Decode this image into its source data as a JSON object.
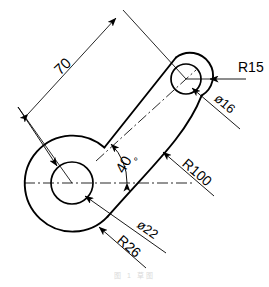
{
  "drawing": {
    "title": "Rocker arm / link plate engineering sketch",
    "type": "2d-technical-drawing",
    "units": "mm",
    "stroke_color": "#000000",
    "background_color": "#ffffff",
    "caption": "图 1    草图"
  },
  "dimensions": [
    {
      "id": "len-70",
      "label": "70",
      "kind": "linear",
      "value": 70,
      "note": "center-to-center distance"
    },
    {
      "id": "ang-40",
      "label": "40",
      "kind": "angular",
      "value": 40,
      "symbol": "°",
      "note": "angle of center axis from horizontal"
    },
    {
      "id": "rad-R15",
      "label": "R15",
      "kind": "radius",
      "value": 15,
      "note": "small boss outer radius"
    },
    {
      "id": "dia-16",
      "label": "ø16",
      "kind": "diameter",
      "value": 16,
      "note": "small bore diameter"
    },
    {
      "id": "rad-R100",
      "label": "R100",
      "kind": "radius",
      "value": 100,
      "note": "concave lower flank"
    },
    {
      "id": "dia-22",
      "label": "ø22",
      "kind": "diameter",
      "value": 22,
      "note": "large bore diameter"
    },
    {
      "id": "rad-R26",
      "label": "R26",
      "kind": "radius",
      "value": 26,
      "note": "large boss outer radius"
    }
  ],
  "features": {
    "large_boss": {
      "name": "large-boss",
      "bore_label": "ø22",
      "outer_label": "R26"
    },
    "small_boss": {
      "name": "small-boss",
      "bore_label": "ø16",
      "outer_label": "R15"
    },
    "web": {
      "name": "connecting-web",
      "fillet_label": "R100"
    }
  }
}
